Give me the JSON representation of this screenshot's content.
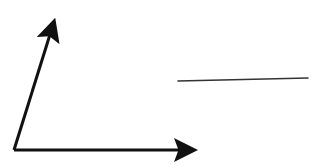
{
  "diagram": {
    "background": "#ffffff",
    "stroke_color": "#111111",
    "line_color": "#333333",
    "origin": [
      14,
      150
    ],
    "arrows": [
      {
        "name": "horizontal-axis-arrow",
        "from": [
          14,
          150
        ],
        "to": [
          204,
          150
        ],
        "width": 3
      },
      {
        "name": "slanted-vector-arrow",
        "from": [
          14,
          150
        ],
        "to": [
          57,
          12
        ],
        "width": 3
      }
    ],
    "segments": [
      {
        "name": "floating-line-segment",
        "from": [
          178,
          81
        ],
        "to": [
          308,
          78
        ],
        "width": 1.6
      }
    ]
  }
}
